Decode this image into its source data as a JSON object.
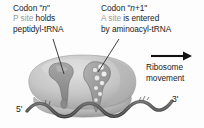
{
  "figure": {
    "background_color": "#fdfdfd"
  },
  "labels": {
    "p_site": {
      "line1_prefix": "Codon \"",
      "line1_italic": "n",
      "line1_suffix": "\"",
      "line2_term": "P site",
      "line2_rest": " holds",
      "line3": "peptidyl-tRNA"
    },
    "a_site": {
      "line1_prefix": "Codon \"",
      "line1_italic": "n",
      "line1_suffix": "+1\"",
      "line2_term": "A site",
      "line2_rest": " is entered",
      "line3": "by aminoacyl-tRNA"
    },
    "movement": {
      "line1": "Ribosome",
      "line2": "movement"
    },
    "five_prime": "5'",
    "three_prime": "3'"
  },
  "colors": {
    "text": "#1b1b1b",
    "site_term_gray": "#9a9a9a",
    "ribosome_body": "#c9c9c9",
    "ribosome_body_dark": "#a8a8a8",
    "ribosome_small_subunit": "#b5b5b5",
    "trna_dark": "#8f8f8f",
    "trna_outline": "#6f6f6f",
    "bead_light": "#ededed",
    "mrna_strand": "#5a5a5a",
    "leader_line": "#2a2a2a",
    "arrow": "#111111"
  }
}
